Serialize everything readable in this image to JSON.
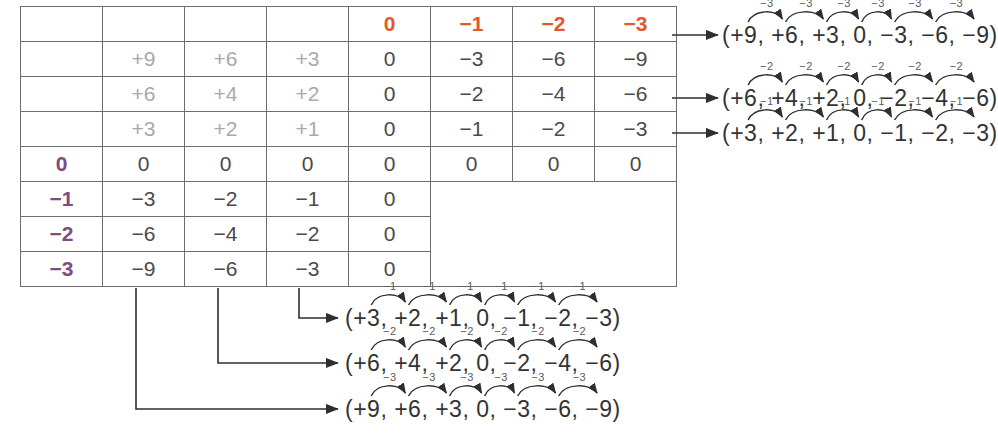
{
  "table": {
    "corner_symbol": "×",
    "column_headers": [
      {
        "label": "+3",
        "tone": "white"
      },
      {
        "label": "+2",
        "tone": "white"
      },
      {
        "label": "+1",
        "tone": "white"
      },
      {
        "label": "0",
        "tone": "orange"
      },
      {
        "label": "−1",
        "tone": "orange"
      },
      {
        "label": "−2",
        "tone": "orange"
      },
      {
        "label": "−3",
        "tone": "orange"
      }
    ],
    "row_headers": [
      {
        "label": "+3",
        "tone": "white"
      },
      {
        "label": "+2",
        "tone": "white"
      },
      {
        "label": "+1",
        "tone": "white"
      },
      {
        "label": "0",
        "tone": "purple"
      },
      {
        "label": "−1",
        "tone": "purple"
      },
      {
        "label": "−2",
        "tone": "purple"
      },
      {
        "label": "−3",
        "tone": "purple"
      }
    ],
    "rows": [
      [
        "+9",
        "+6",
        "+3",
        "0",
        "−3",
        "−6",
        "−9"
      ],
      [
        "+6",
        "+4",
        "+2",
        "0",
        "−2",
        "−4",
        "−6"
      ],
      [
        "+3",
        "+2",
        "+1",
        "0",
        "−1",
        "−2",
        "−3"
      ],
      [
        "0",
        "0",
        "0",
        "0",
        "0",
        "0",
        "0"
      ],
      [
        "−3",
        "−2",
        "−1",
        "0",
        "",
        "",
        ""
      ],
      [
        "−6",
        "−4",
        "−2",
        "0",
        "",
        "",
        ""
      ],
      [
        "−9",
        "−6",
        "−3",
        "0",
        "",
        "",
        ""
      ]
    ]
  },
  "row_annotations": [
    {
      "id": "row-annotation-3",
      "terms": [
        "(+9,",
        "+6,",
        "+3,",
        "0,",
        "−3,",
        "−6,",
        "−9)"
      ],
      "step_label": "−3",
      "step_count": 6
    },
    {
      "id": "row-annotation-2",
      "terms": [
        "(+6,",
        "+4,",
        "+2,",
        "0,",
        "−2,",
        "−4,",
        "−6)"
      ],
      "step_label": "−2",
      "step_count": 6
    },
    {
      "id": "row-annotation-1",
      "terms": [
        "(+3,",
        "+2,",
        "+1,",
        "0,",
        "−1,",
        "−2,",
        "−3)"
      ],
      "step_label": "−1",
      "step_count": 6
    }
  ],
  "column_annotations": [
    {
      "id": "column-annotation-1",
      "terms": [
        "(+3,",
        "+2,",
        "+1,",
        "0,",
        "−1,",
        "−2,",
        "−3)"
      ],
      "step_label": "−1",
      "step_count": 6
    },
    {
      "id": "column-annotation-2",
      "terms": [
        "(+6,",
        "+4,",
        "+2,",
        "0,",
        "−2,",
        "−4,",
        "−6)"
      ],
      "step_label": "−2",
      "step_count": 6
    },
    {
      "id": "column-annotation-3",
      "terms": [
        "(+9,",
        "+6,",
        "+3,",
        "0,",
        "−3,",
        "−6,",
        "−9)"
      ],
      "step_label": "−3",
      "step_count": 6
    }
  ],
  "colors": {
    "header_fill": "#a8a8a8",
    "corner_fill": "#3b3a3a",
    "orange": "#e0592c",
    "purple": "#7d4b80",
    "grid": "#6e6e6e",
    "ink": "#333333",
    "faint": "#a9a9a9"
  }
}
